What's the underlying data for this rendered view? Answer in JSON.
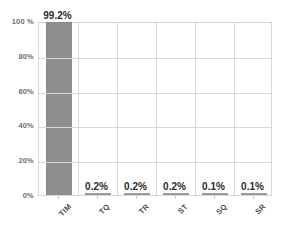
{
  "chart_data": {
    "type": "bar",
    "title": "",
    "xlabel": "",
    "ylabel": "",
    "categories": [
      "TIM",
      "TQ",
      "TR",
      "ST",
      "SQ",
      "SR"
    ],
    "values": [
      99.2,
      0.2,
      0.2,
      0.2,
      0.1,
      0.1
    ],
    "value_labels": [
      "99.2%",
      "0.2%",
      "0.2%",
      "0.2%",
      "0.1%",
      "0.1%"
    ],
    "ylim": [
      0,
      100
    ],
    "yticks": [
      0,
      20,
      40,
      60,
      80,
      100
    ],
    "ytick_labels": [
      "0%",
      "20%",
      "40%",
      "60%",
      "80%",
      "100 %"
    ],
    "grid": true,
    "legend": false,
    "legend_position": "none",
    "series": [
      {
        "name": "share",
        "values": [
          99.2,
          0.2,
          0.2,
          0.2,
          0.1,
          0.1
        ]
      }
    ],
    "colors": {
      "bar_fill": "#8e8e8e",
      "gridline": "#d8d8d8",
      "plot_border": "#d6d6d6",
      "ytick_text": "#6f6f6f",
      "xtick_text": "#4a4a4a",
      "value_text": "#2b2b2b",
      "background": "#ffffff"
    }
  }
}
